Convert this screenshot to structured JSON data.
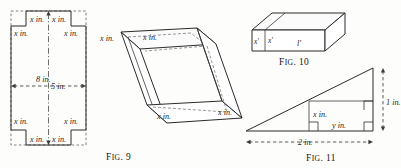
{
  "page": {
    "background_color": "#fdfdfb",
    "ink_color": "#1d1d1d"
  },
  "figures": [
    {
      "id": "fig9-flat",
      "caption": "Fig. 9",
      "caption_lead": "F",
      "caption_rest": "IG",
      "caption_tail": ". 9",
      "description": "flat sheet with square corners cut out",
      "labels": {
        "corner_top_left_inner": "x in.",
        "corner_top_right_inner": "x in.",
        "side_top_left": "x in.",
        "side_top_right": "x in.",
        "side_bottom_left": "x in.",
        "side_bottom_right": "x in.",
        "corner_bottom_left_inner": "x in.",
        "corner_bottom_right_inner": "x in.",
        "height": "8 in.",
        "width": "5 in."
      }
    },
    {
      "id": "fig9-box",
      "caption": "",
      "description": "open box folded from the sheet",
      "labels": {
        "top_left_flap": "x in.",
        "top_edge": "x in.",
        "front_edge": "x in.",
        "right_edge": "x in."
      }
    },
    {
      "id": "fig10",
      "caption": "Fig. 10",
      "caption_lead": "F",
      "caption_rest": "IG",
      "caption_tail": ". 10",
      "description": "solid rectangular block",
      "labels": {
        "left_face_height": "x'",
        "front_face_height": "x'",
        "length": "l'"
      }
    },
    {
      "id": "fig11",
      "caption": "Fig. 11",
      "caption_lead": "F",
      "caption_rest": "IG",
      "caption_tail": ". 11",
      "description": "right triangle with inscribed rectangle",
      "labels": {
        "inner_vertical": "x in.",
        "inner_horizontal": "y in.",
        "right_height": "1 in.",
        "base": "2 in."
      }
    }
  ]
}
